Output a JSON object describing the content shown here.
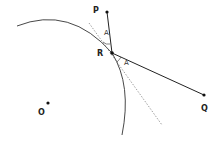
{
  "diagram": {
    "type": "geometry-reflection",
    "points": [
      {
        "id": "P",
        "label": "P",
        "x": 107,
        "y": 12
      },
      {
        "id": "R",
        "label": "R",
        "x": 112,
        "y": 53
      },
      {
        "id": "Q",
        "label": "Q",
        "x": 204,
        "y": 95
      },
      {
        "id": "O",
        "label": "O",
        "x": 48,
        "y": 103
      }
    ],
    "angle_labels": [
      {
        "label": "A",
        "x": 104,
        "y": 33
      },
      {
        "label": "A",
        "x": 124,
        "y": 62
      }
    ],
    "segments": [
      {
        "from": "P",
        "to": "R",
        "style": "solid"
      },
      {
        "from": "R",
        "to": "Q",
        "style": "solid"
      }
    ],
    "tangent_line": {
      "style": "dotted",
      "from": [
        89,
        23
      ],
      "to": [
        162,
        125
      ]
    },
    "arc": {
      "style": "solid",
      "description": "circular arc (mirror) centered near O"
    }
  }
}
